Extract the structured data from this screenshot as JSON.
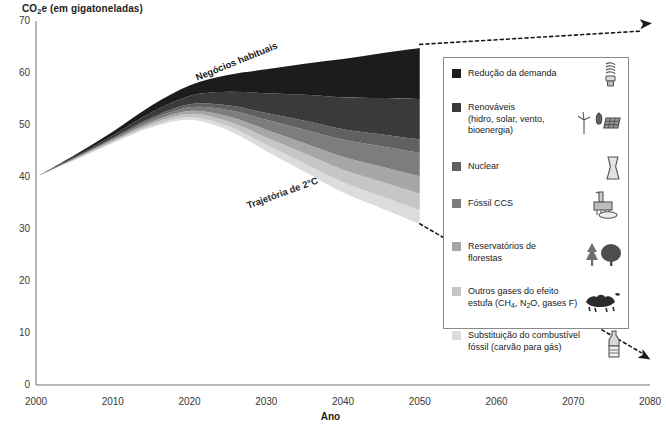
{
  "axes": {
    "y_label_prefix": "CO",
    "y_label_sub": "2",
    "y_label_suffix": "e (em gigatoneladas)",
    "x_label": "Ano",
    "y_ticks": [
      "70",
      "60",
      "50",
      "40",
      "30",
      "20",
      "10",
      "0"
    ],
    "x_ticks": [
      "2000",
      "2010",
      "2020",
      "2030",
      "2040",
      "2050",
      "2060",
      "2070",
      "2080"
    ]
  },
  "annotations": {
    "bau": "Negócios habituais",
    "pathway": "Trajetória de 2°C"
  },
  "legend": {
    "items": [
      {
        "label": "Redução da demanda",
        "color": "#1c1c1c",
        "icon": "compact-fluorescent-bulb-icon"
      },
      {
        "label_line1": "Renováveis",
        "label_line2": "(hidro, solar, vento,",
        "label_line3": "bioenergia)",
        "color": "#3a3a3a",
        "icon": "wind-turbine-solar-panel-icon"
      },
      {
        "label": "Nuclear",
        "color": "#616161",
        "icon": "cooling-tower-icon"
      },
      {
        "label": "Fóssil CCS",
        "color": "#7d7d7d",
        "icon": "ccs-plant-icon"
      },
      {
        "label_line1": "Reservatórios de",
        "label_line2": "florestas",
        "color": "#a6a6a6",
        "icon": "trees-icon"
      },
      {
        "label_line1": "Outros gases do efeito",
        "label_line2_pre": "estufa (CH",
        "label_sub1": "4",
        "label_line2_mid": ", N",
        "label_sub2": "2",
        "label_line2_post": "O, gases F)",
        "color": "#c6c6c6",
        "icon": "livestock-icon"
      },
      {
        "label_line1": "Substituição do combustível",
        "label_line2": "fóssil (carvão para gás)",
        "color": "#dcdcdc",
        "icon": "gas-bottle-icon"
      }
    ]
  },
  "chart_data": {
    "type": "area",
    "title": "",
    "xlabel": "Ano",
    "ylabel": "CO2e (em gigatoneladas)",
    "xlim": [
      2000,
      2080
    ],
    "ylim": [
      0,
      70
    ],
    "grid": false,
    "legend_position": "inside-right",
    "x": [
      2000,
      2005,
      2010,
      2015,
      2020,
      2025,
      2030,
      2035,
      2040,
      2045,
      2050
    ],
    "baseline_name": "Trajetória de 2°C",
    "baseline_values": [
      40.0,
      43.2,
      46.5,
      49.5,
      51.0,
      49.0,
      45.0,
      41.0,
      37.0,
      34.0,
      31.0
    ],
    "top_name": "Negócios habituais",
    "top_values": [
      40.0,
      44.0,
      48.5,
      53.5,
      57.0,
      59.0,
      61.0,
      62.5,
      63.7,
      64.7,
      65.5
    ],
    "series": [
      {
        "name": "Redução da demanda",
        "color": "#1c1c1c",
        "values": [
          0.0,
          0.3,
          0.7,
          1.3,
          2.0,
          3.2,
          4.6,
          6.0,
          7.4,
          8.6,
          9.8
        ]
      },
      {
        "name": "Renováveis (hidro, solar, vento, bioenergia)",
        "color": "#3a3a3a",
        "values": [
          0.0,
          0.2,
          0.5,
          1.0,
          1.6,
          2.6,
          3.8,
          5.0,
          6.1,
          7.0,
          7.8
        ]
      },
      {
        "name": "Nuclear",
        "color": "#616161",
        "values": [
          0.0,
          0.1,
          0.2,
          0.4,
          0.6,
          0.9,
          1.3,
          1.7,
          2.0,
          2.3,
          2.6
        ]
      },
      {
        "name": "Fóssil CCS",
        "color": "#7d7d7d",
        "values": [
          0.0,
          0.1,
          0.2,
          0.4,
          0.7,
          1.2,
          1.9,
          2.6,
          3.3,
          3.9,
          4.5
        ]
      },
      {
        "name": "Reservatórios de florestas",
        "color": "#a6a6a6",
        "values": [
          0.0,
          0.1,
          0.2,
          0.4,
          0.6,
          1.0,
          1.5,
          2.0,
          2.5,
          2.9,
          3.3
        ]
      },
      {
        "name": "Outros gases do efeito estufa (CH4, N2O, gases F)",
        "color": "#c6c6c6",
        "values": [
          0.0,
          0.1,
          0.2,
          0.4,
          0.6,
          0.9,
          1.4,
          1.9,
          2.4,
          2.8,
          3.2
        ]
      },
      {
        "name": "Substituição do combustível fóssil (carvão para gás)",
        "color": "#dcdcdc",
        "values": [
          0.0,
          0.1,
          0.2,
          0.3,
          0.5,
          0.8,
          1.2,
          1.6,
          2.0,
          2.3,
          2.6
        ]
      }
    ],
    "projection_arrows": [
      {
        "name": "bau-projection",
        "from": [
          2050,
          65.5
        ],
        "to": [
          2080,
          68.8
        ],
        "style": "dashed"
      },
      {
        "name": "pathway-projection",
        "from": [
          2050,
          31.0
        ],
        "to": [
          2080,
          5.5
        ],
        "style": "dashed"
      }
    ]
  }
}
